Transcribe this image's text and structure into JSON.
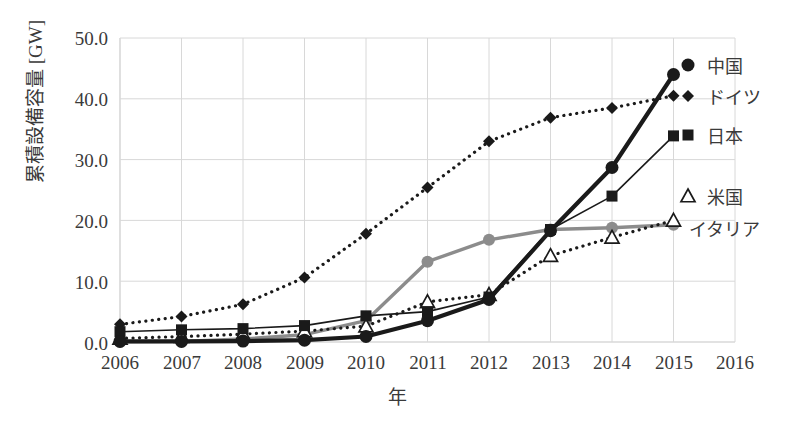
{
  "chart_data": {
    "type": "line",
    "title": "",
    "xlabel": "年",
    "ylabel": "累積設備容量 [GW]",
    "x": [
      2006,
      2007,
      2008,
      2009,
      2010,
      2011,
      2012,
      2013,
      2014,
      2015
    ],
    "xticklabels": [
      "2006",
      "2007",
      "2008",
      "2009",
      "2010",
      "2011",
      "2012",
      "2013",
      "2014",
      "2015",
      "2016"
    ],
    "yticklabels": [
      "0.0",
      "10.0",
      "20.0",
      "30.0",
      "40.0",
      "50.0"
    ],
    "xlim": [
      2006,
      2016
    ],
    "ylim": [
      0,
      50
    ],
    "grid": true,
    "legend_position": "right",
    "series": [
      {
        "name": "中国",
        "marker": "circle",
        "linestyle": "solid-thick",
        "color": "#1a1a1a",
        "values": [
          0.1,
          0.1,
          0.15,
          0.3,
          0.9,
          3.5,
          7.0,
          18.3,
          28.7,
          44.0
        ]
      },
      {
        "name": "ドイツ",
        "marker": "diamond",
        "linestyle": "dotted",
        "color": "#1a1a1a",
        "values": [
          2.9,
          4.2,
          6.2,
          10.6,
          17.8,
          25.4,
          33.0,
          36.9,
          38.5,
          40.5
        ]
      },
      {
        "name": "日本",
        "marker": "square",
        "linestyle": "solid-thin",
        "color": "#1a1a1a",
        "values": [
          1.7,
          2.0,
          2.2,
          2.7,
          4.3,
          5.0,
          7.4,
          18.5,
          24.0,
          33.9
        ]
      },
      {
        "name": "米国",
        "marker": "triangle-open",
        "linestyle": "dotted",
        "color": "#1a1a1a",
        "values": [
          0.6,
          0.9,
          1.3,
          1.8,
          2.6,
          6.6,
          7.8,
          14.2,
          17.2,
          20.0
        ]
      },
      {
        "name": "イタリア",
        "marker": "circle",
        "linestyle": "solid-gray",
        "color": "#8c8c8c",
        "values": [
          0.05,
          0.1,
          0.5,
          1.2,
          3.5,
          13.2,
          16.8,
          18.5,
          18.8,
          19.3
        ]
      }
    ]
  },
  "legend": {
    "items": [
      {
        "label": "中国"
      },
      {
        "label": "ドイツ"
      },
      {
        "label": "日本"
      },
      {
        "label": "米国"
      },
      {
        "label": "イタリア"
      }
    ]
  },
  "colors": {
    "axis": "#d8d8d8",
    "text": "#3a3a3a",
    "dark_series": "#1a1a1a",
    "gray_series": "#8c8c8c",
    "background": "#ffffff"
  }
}
